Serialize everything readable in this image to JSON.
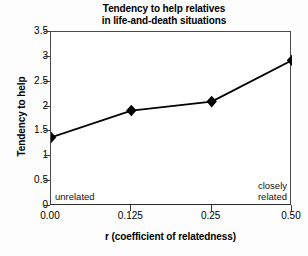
{
  "chart_data": {
    "type": "line",
    "title": "Tendency to help relatives in life-and-death situations",
    "title_lines": [
      "Tendency to help relatives",
      "in life-and-death situations"
    ],
    "xlabel": "r (coefficient of relatedness)",
    "ylabel": "Tendency to help",
    "categories": [
      "0.00",
      "0.125",
      "0.25",
      "0.50"
    ],
    "x": [
      0.0,
      0.125,
      0.25,
      0.5
    ],
    "values": [
      1.38,
      1.92,
      2.1,
      2.93
    ],
    "ylim": [
      0,
      3.5
    ],
    "yticks": [
      "0",
      "0.5",
      "1",
      "1.5",
      "2",
      "2.5",
      "3",
      "3.5"
    ],
    "ytick_values": [
      0,
      0.5,
      1,
      1.5,
      2,
      2.5,
      3,
      3.5
    ],
    "xticks": [
      "0.00",
      "0.125",
      "0.25",
      "0.50"
    ],
    "grid": false,
    "legend": "none",
    "marker": "diamond",
    "series_color": "#000000",
    "annotations": [
      {
        "text": "unrelated",
        "position": "bottom-left"
      },
      {
        "text": "closely\nrelated",
        "line1": "closely",
        "line2": "related",
        "position": "bottom-right"
      }
    ]
  },
  "annotations": {
    "left": "unrelated",
    "right_line1": "closely",
    "right_line2": "related"
  }
}
